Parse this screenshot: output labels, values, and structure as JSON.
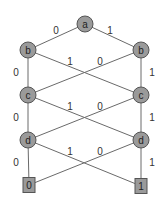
{
  "diagram": {
    "type": "binary-decision-diagram",
    "colors": {
      "node_fill": "#9a9a9a",
      "node_stroke": "#555555",
      "edge": "#6a6a6a",
      "text": "#222222"
    },
    "nodes": [
      {
        "id": "a",
        "label": "a",
        "x": 85,
        "y": 24
      },
      {
        "id": "bL",
        "label": "b",
        "x": 28,
        "y": 50
      },
      {
        "id": "bR",
        "label": "b",
        "x": 141,
        "y": 50
      },
      {
        "id": "cL",
        "label": "c",
        "x": 28,
        "y": 95
      },
      {
        "id": "cR",
        "label": "c",
        "x": 141,
        "y": 95
      },
      {
        "id": "dL",
        "label": "d",
        "x": 28,
        "y": 140
      },
      {
        "id": "dR",
        "label": "d",
        "x": 141,
        "y": 140
      }
    ],
    "terminals": [
      {
        "id": "t0",
        "label": "0",
        "x": 29,
        "y": 185
      },
      {
        "id": "t1",
        "label": "1",
        "x": 141,
        "y": 186
      }
    ],
    "edges": [
      {
        "from": "a",
        "to": "bL",
        "label": "0",
        "lx": 56,
        "ly": 30
      },
      {
        "from": "a",
        "to": "bR",
        "label": "1",
        "lx": 110,
        "ly": 30
      },
      {
        "from": "bL",
        "to": "cL",
        "label": "0",
        "lx": 16,
        "ly": 72
      },
      {
        "from": "bL",
        "to": "cR",
        "label": "1",
        "lx": 70,
        "ly": 61
      },
      {
        "from": "bR",
        "to": "cL",
        "label": "0",
        "lx": 100,
        "ly": 61
      },
      {
        "from": "bR",
        "to": "cR",
        "label": "1",
        "lx": 152,
        "ly": 72
      },
      {
        "from": "cL",
        "to": "dL",
        "label": "0",
        "lx": 16,
        "ly": 117
      },
      {
        "from": "cL",
        "to": "dR",
        "label": "1",
        "lx": 70,
        "ly": 106
      },
      {
        "from": "cR",
        "to": "dL",
        "label": "0",
        "lx": 100,
        "ly": 106
      },
      {
        "from": "cR",
        "to": "dR",
        "label": "1",
        "lx": 152,
        "ly": 117
      },
      {
        "from": "dL",
        "to": "t0",
        "label": "0",
        "lx": 16,
        "ly": 162
      },
      {
        "from": "dL",
        "to": "t1",
        "label": "1",
        "lx": 70,
        "ly": 151
      },
      {
        "from": "dR",
        "to": "t0",
        "label": "0",
        "lx": 100,
        "ly": 151
      },
      {
        "from": "dR",
        "to": "t1",
        "label": "1",
        "lx": 152,
        "ly": 162
      }
    ]
  }
}
